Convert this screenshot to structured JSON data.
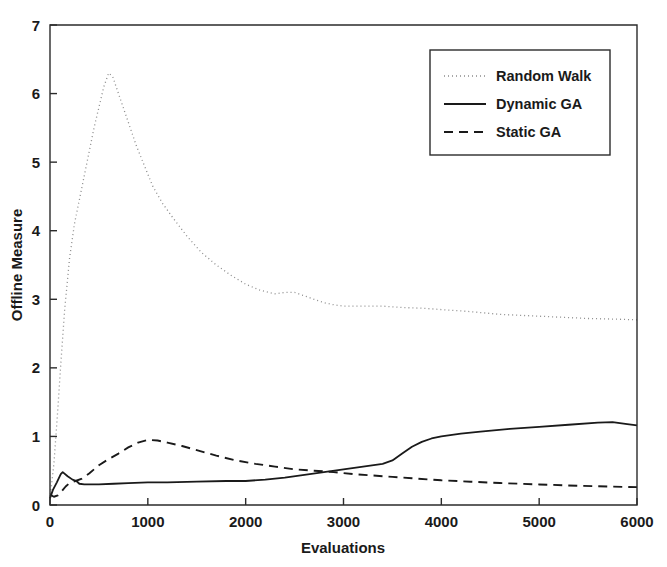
{
  "chart_data": {
    "type": "line",
    "title": "",
    "xlabel": "Evaluations",
    "ylabel": "Offline Measure",
    "xlim": [
      0,
      6000
    ],
    "ylim": [
      0,
      7
    ],
    "xticks": [
      0,
      1000,
      2000,
      3000,
      4000,
      5000,
      6000
    ],
    "xtick_labels": [
      "0",
      "1000",
      "2000",
      "3000",
      "4000",
      "5000",
      "6000"
    ],
    "yticks": [
      0,
      1,
      2,
      3,
      4,
      5,
      6,
      7
    ],
    "ytick_labels": [
      "0",
      "1",
      "2",
      "3",
      "4",
      "5",
      "6",
      "7"
    ],
    "grid": false,
    "legend_position": "upper right",
    "series": [
      {
        "name": "Random Walk",
        "style": "dotted",
        "color": "#8c8c8c",
        "width": 1.3,
        "dash": "1,3",
        "x": [
          0,
          40,
          80,
          110,
          150,
          200,
          250,
          300,
          350,
          400,
          450,
          500,
          550,
          600,
          640,
          700,
          760,
          820,
          880,
          950,
          1050,
          1150,
          1250,
          1400,
          1550,
          1700,
          1850,
          2000,
          2150,
          2300,
          2400,
          2500,
          2600,
          2700,
          2800,
          2900,
          3000,
          3200,
          3400,
          3600,
          3800,
          4000,
          4300,
          4600,
          4900,
          5200,
          5500,
          5800,
          6000
        ],
        "y": [
          0.1,
          0.6,
          1.4,
          2.05,
          2.85,
          3.6,
          4.1,
          4.45,
          4.8,
          5.15,
          5.5,
          5.8,
          6.1,
          6.3,
          6.25,
          6.0,
          5.75,
          5.5,
          5.25,
          5.0,
          4.65,
          4.4,
          4.2,
          3.92,
          3.68,
          3.5,
          3.35,
          3.22,
          3.13,
          3.08,
          3.1,
          3.1,
          3.05,
          3.0,
          2.95,
          2.92,
          2.9,
          2.9,
          2.9,
          2.88,
          2.87,
          2.85,
          2.82,
          2.78,
          2.76,
          2.74,
          2.72,
          2.71,
          2.7
        ]
      },
      {
        "name": "Dynamic GA",
        "style": "solid",
        "color": "#1a1a1a",
        "width": 1.8,
        "dash": "",
        "x": [
          0,
          30,
          70,
          110,
          130,
          180,
          230,
          270,
          300,
          350,
          420,
          500,
          650,
          800,
          1000,
          1200,
          1500,
          1800,
          2000,
          2200,
          2400,
          2600,
          2800,
          3000,
          3200,
          3400,
          3500,
          3600,
          3700,
          3800,
          3900,
          4000,
          4200,
          4400,
          4700,
          5000,
          5300,
          5600,
          5750,
          5900,
          6000
        ],
        "y": [
          0.1,
          0.22,
          0.33,
          0.45,
          0.48,
          0.42,
          0.37,
          0.35,
          0.31,
          0.3,
          0.3,
          0.3,
          0.31,
          0.32,
          0.33,
          0.33,
          0.34,
          0.35,
          0.35,
          0.37,
          0.4,
          0.44,
          0.48,
          0.52,
          0.56,
          0.6,
          0.65,
          0.75,
          0.85,
          0.92,
          0.97,
          1.0,
          1.04,
          1.07,
          1.11,
          1.14,
          1.17,
          1.2,
          1.21,
          1.18,
          1.16
        ]
      },
      {
        "name": "Static GA",
        "style": "dashed",
        "color": "#1a1a1a",
        "width": 1.9,
        "dash": "9,6",
        "x": [
          0,
          40,
          80,
          120,
          160,
          200,
          260,
          320,
          400,
          500,
          600,
          700,
          800,
          900,
          1000,
          1100,
          1200,
          1350,
          1500,
          1700,
          1900,
          2100,
          2300,
          2500,
          2700,
          2900,
          3100,
          3300,
          3500,
          3700,
          4000,
          4300,
          4600,
          5000,
          5400,
          5700,
          6000
        ],
        "y": [
          0.15,
          0.12,
          0.14,
          0.2,
          0.27,
          0.32,
          0.35,
          0.38,
          0.46,
          0.58,
          0.67,
          0.75,
          0.84,
          0.91,
          0.95,
          0.94,
          0.91,
          0.86,
          0.8,
          0.72,
          0.65,
          0.6,
          0.56,
          0.52,
          0.5,
          0.48,
          0.45,
          0.43,
          0.41,
          0.39,
          0.36,
          0.34,
          0.32,
          0.3,
          0.28,
          0.27,
          0.26
        ]
      }
    ]
  },
  "legend": {
    "entries": [
      {
        "label": "Random Walk"
      },
      {
        "label": "Dynamic GA"
      },
      {
        "label": "Static GA"
      }
    ]
  },
  "axes": {
    "x_title": "Evaluations",
    "y_title": "Offline Measure"
  }
}
